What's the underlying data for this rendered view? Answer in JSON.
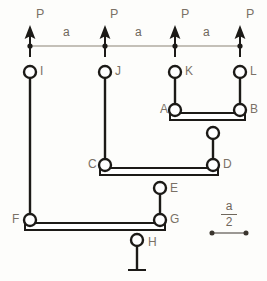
{
  "diagram": {
    "colors": {
      "member": "#1c1a17",
      "load_line": "#7d756a",
      "label": "#7a7166",
      "background": "#fdfdfb"
    },
    "loads": [
      {
        "label": "P",
        "x": 30,
        "label_x": 36,
        "label_y": 8
      },
      {
        "label": "P",
        "x": 105,
        "label_x": 110,
        "label_y": 8
      },
      {
        "label": "P",
        "x": 175,
        "label_x": 181,
        "label_y": 8
      },
      {
        "label": "P",
        "x": 240,
        "label_x": 246,
        "label_y": 8
      }
    ],
    "spans": [
      {
        "label": "a",
        "label_x": 63,
        "label_y": 26
      },
      {
        "label": "a",
        "label_x": 135,
        "label_y": 26
      },
      {
        "label": "a",
        "label_x": 203,
        "label_y": 26
      }
    ],
    "load_line_y": 46,
    "joints": [
      {
        "id": "I",
        "x": 30,
        "y": 72,
        "label_x": 40,
        "label_y": 65
      },
      {
        "id": "J",
        "x": 105,
        "y": 72,
        "label_x": 115,
        "label_y": 65
      },
      {
        "id": "K",
        "x": 175,
        "y": 72,
        "label_x": 185,
        "label_y": 65
      },
      {
        "id": "L",
        "x": 240,
        "y": 72,
        "label_x": 250,
        "label_y": 65
      },
      {
        "id": "A",
        "x": 175,
        "y": 110,
        "label_x": 160,
        "label_y": 103
      },
      {
        "id": "B",
        "x": 240,
        "y": 110,
        "label_x": 250,
        "label_y": 103
      },
      {
        "id": "C",
        "x": 105,
        "y": 165,
        "label_x": 88,
        "label_y": 158
      },
      {
        "id": "D",
        "x": 213,
        "y": 165,
        "label_x": 223,
        "label_y": 158
      },
      {
        "id": "E",
        "x": 160,
        "y": 188,
        "label_x": 170,
        "label_y": 182
      },
      {
        "id": "F",
        "x": 30,
        "y": 220,
        "label_x": 12,
        "label_y": 213
      },
      {
        "id": "G",
        "x": 160,
        "y": 220,
        "label_x": 170,
        "label_y": 213
      },
      {
        "id": "H",
        "x": 137,
        "y": 240,
        "label_x": 148,
        "label_y": 236
      }
    ],
    "unlabeled_joints": [
      {
        "x": 213,
        "y": 133
      }
    ],
    "scale_reference": {
      "numerator": "a",
      "denominator": "2",
      "x_left": 209,
      "x_right": 249,
      "y": 233,
      "frac_x": 209,
      "frac_y": 202
    },
    "support": {
      "type": "fixed-ground",
      "x": 137,
      "top_y": 246,
      "base_y": 272,
      "base_half_width": 9
    }
  }
}
